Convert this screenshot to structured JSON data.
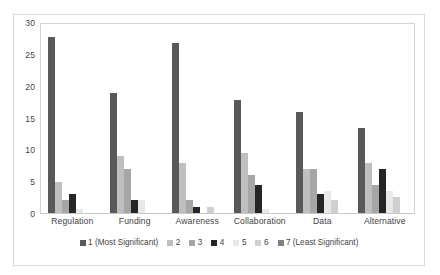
{
  "chart_data": {
    "type": "bar",
    "title": "",
    "subtitle": "",
    "xlabel": "",
    "ylabel": "",
    "ylim": [
      0,
      30
    ],
    "ytick_labels": [
      "0",
      "5",
      "10",
      "15",
      "20",
      "25",
      "30"
    ],
    "ytick_values": [
      0,
      5,
      10,
      15,
      20,
      25,
      30
    ],
    "grid": false,
    "legend_position": "bottom",
    "categories": [
      "Regulation",
      "Funding",
      "Awareness",
      "Collaboration",
      "Data",
      "Alternative"
    ],
    "series": [
      {
        "name": "1 (Most Significant)",
        "color": "#595959",
        "values": [
          28,
          19,
          27,
          18,
          16,
          13.5
        ]
      },
      {
        "name": "2",
        "color": "#bfbfbf",
        "values": [
          5,
          9,
          8,
          9.5,
          7,
          8
        ]
      },
      {
        "name": "3",
        "color": "#a6a6a6",
        "values": [
          2,
          7,
          2,
          6,
          7,
          4.5
        ]
      },
      {
        "name": "4",
        "color": "#262626",
        "values": [
          3,
          2,
          1,
          4.5,
          3,
          7
        ]
      },
      {
        "name": "5",
        "color": "#e8e8e8",
        "values": [
          0.6,
          2,
          0,
          0.6,
          3.5,
          3.5
        ]
      },
      {
        "name": "6",
        "color": "#d0d0d0",
        "values": [
          0,
          0,
          1,
          0,
          2,
          2.5
        ]
      },
      {
        "name": "7 (Least Significant)",
        "color": "#808080",
        "values": [
          0,
          0,
          0,
          0,
          0,
          0
        ]
      }
    ]
  },
  "legend": {
    "entries": [
      "1 (Most Significant)",
      "2",
      "3",
      "4",
      "5",
      "6",
      "7 (Least Significant)"
    ]
  }
}
